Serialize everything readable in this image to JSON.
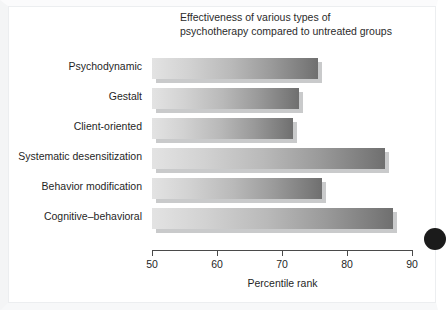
{
  "chart_data": {
    "type": "bar",
    "orientation": "horizontal",
    "title": "Effectiveness of various types of\npsychotherapy compared to untreated groups",
    "xlabel": "Percentile rank",
    "ylabel": "",
    "xlim": [
      50,
      90
    ],
    "xticks": [
      50,
      60,
      70,
      80,
      90
    ],
    "xtick_labels": [
      "50",
      "60",
      "70",
      "80",
      "90"
    ],
    "grid": false,
    "legend": false,
    "categories": [
      "Psychodynamic",
      "Gestalt",
      "Client-oriented",
      "Systematic desensitization",
      "Behavior modification",
      "Cognitive–behavioral"
    ],
    "values": [
      75.5,
      72.6,
      71.7,
      85.8,
      76.2,
      87.0
    ],
    "bar_style": {
      "gradient_start": "#e3e3e3",
      "gradient_end": "#6f6f6f",
      "shadow_color": "#c9cacb"
    }
  },
  "figure": {
    "background": "#ffffff",
    "frame_color": "#eceef0",
    "axis_color": "#4a4a4a",
    "text_color": "#1f1f1f",
    "corner_mark": "bullet-circle"
  }
}
